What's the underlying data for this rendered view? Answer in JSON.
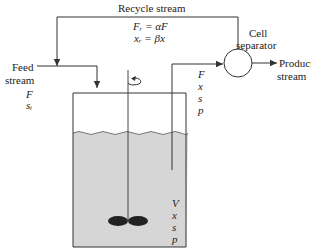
{
  "diagram": {
    "type": "chemostat with cell recycle",
    "recycle": {
      "label": "Recycle stream",
      "flow_eq": "Fᵣ = αF",
      "conc_eq": "xᵣ = βx"
    },
    "feed": {
      "label_line1": "Feed",
      "label_line2": "stream",
      "var1": "F",
      "var2": "sᵢ"
    },
    "separator": {
      "label_line1": "Cell",
      "label_line2": "separator"
    },
    "product": {
      "label_line1": "Product",
      "label_line2": "stream"
    },
    "outlet_vars": [
      "F",
      "x",
      "s",
      "p"
    ],
    "reactor_vars": [
      "V",
      "x",
      "s",
      "p"
    ],
    "colors": {
      "line": "#333333",
      "liquid": "#d4d4d4",
      "impeller": "#222222"
    }
  }
}
